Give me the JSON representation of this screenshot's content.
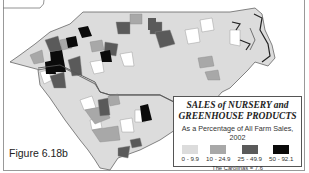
{
  "figure_label": "Figure 6.18b",
  "legend": {
    "title_line1": "SALES of NURSERY and",
    "title_line2": "GREENHOUSE PRODUCTS",
    "subtitle": "As a Percentage of All Farm Sales, 2002",
    "classes": [
      {
        "label": "0 - 9.9",
        "color": "#dcdcdc"
      },
      {
        "label": "10 - 24.9",
        "color": "#a8a8a8"
      },
      {
        "label": "25 - 49.9",
        "color": "#5a5a5a"
      },
      {
        "label": "50 - 92.1",
        "color": "#0a0a0a"
      }
    ],
    "total": "The Carolinas = 7.6"
  },
  "map": {
    "regions": [
      "North Carolina",
      "South Carolina"
    ],
    "colors": {
      "light": "#dcdcdc",
      "medium": "#a8a8a8",
      "dark": "#5a5a5a",
      "black": "#0a0a0a",
      "white": "#ffffff",
      "border": "#666666"
    }
  }
}
